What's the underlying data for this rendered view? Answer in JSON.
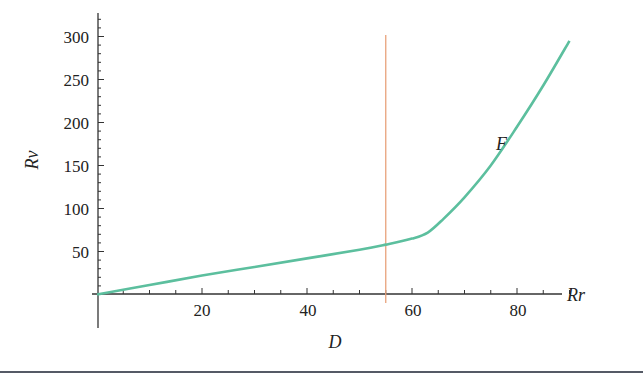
{
  "chart_data": {
    "type": "line",
    "title": "",
    "xlabel": "Rr",
    "ylabel": "Rv",
    "below_axis_label": "D",
    "xlim": [
      0,
      92
    ],
    "ylim": [
      0,
      320
    ],
    "x_ticks": [
      20,
      40,
      60,
      80
    ],
    "y_ticks": [
      50,
      100,
      150,
      200,
      250,
      300
    ],
    "grid": false,
    "series": [
      {
        "name": "F",
        "color": "#5cbf9e",
        "x": [
          0,
          10,
          20,
          30,
          40,
          50,
          55,
          60,
          63,
          66,
          70,
          75,
          80,
          85,
          90
        ],
        "y": [
          0,
          11,
          22,
          32,
          42,
          52,
          58,
          65,
          72,
          88,
          113,
          150,
          195,
          243,
          295
        ]
      }
    ],
    "vertical_line": {
      "x": 55,
      "color": "#e8a27c"
    },
    "annotations": [
      {
        "text": "F",
        "x": 76,
        "y": 170
      }
    ]
  },
  "labels": {
    "x_axis": "Rr",
    "y_axis": "Rv",
    "below": "D",
    "curve": "F",
    "x_ticks": [
      "20",
      "40",
      "60",
      "80"
    ],
    "y_ticks": [
      "50",
      "100",
      "150",
      "200",
      "250",
      "300"
    ]
  }
}
